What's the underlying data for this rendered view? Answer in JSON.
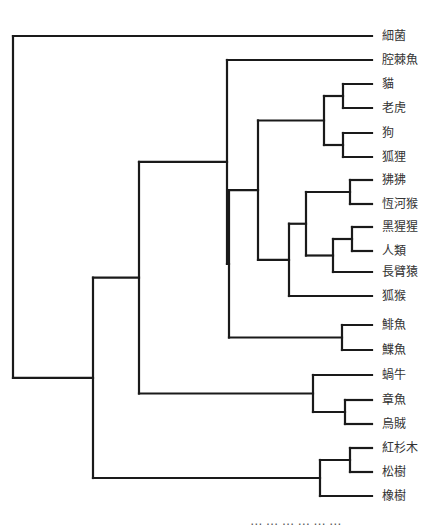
{
  "diagram": {
    "type": "phylogenetic-tree",
    "leaf_x_end": 372,
    "label_x": 382,
    "leaves": [
      {
        "id": "bacteria",
        "label": "細菌",
        "y": 36
      },
      {
        "id": "coelacanth",
        "label": "腔棘魚",
        "y": 60
      },
      {
        "id": "cat",
        "label": "貓",
        "y": 84
      },
      {
        "id": "tiger",
        "label": "老虎",
        "y": 108
      },
      {
        "id": "dog",
        "label": "狗",
        "y": 133
      },
      {
        "id": "fox",
        "label": "狐狸",
        "y": 157
      },
      {
        "id": "baboon",
        "label": "狒狒",
        "y": 180
      },
      {
        "id": "rhesus",
        "label": "恆河猴",
        "y": 204
      },
      {
        "id": "chimp",
        "label": "黑猩猩",
        "y": 227
      },
      {
        "id": "human",
        "label": "人類",
        "y": 251
      },
      {
        "id": "gibbon",
        "label": "長臂猿",
        "y": 272
      },
      {
        "id": "lemur",
        "label": "狐猴",
        "y": 296
      },
      {
        "id": "herring",
        "label": "鯡魚",
        "y": 325
      },
      {
        "id": "flounder",
        "label": "鰈魚",
        "y": 350
      },
      {
        "id": "snail",
        "label": "蝸牛",
        "y": 375
      },
      {
        "id": "octopus",
        "label": "章魚",
        "y": 400
      },
      {
        "id": "squid",
        "label": "烏賊",
        "y": 424
      },
      {
        "id": "redwood",
        "label": "紅杉木",
        "y": 448
      },
      {
        "id": "pine",
        "label": "松樹",
        "y": 472
      },
      {
        "id": "oak",
        "label": "橡樹",
        "y": 496
      }
    ],
    "nodes": [
      {
        "id": "n_catTiger",
        "x": 343,
        "children": [
          "cat",
          "tiger"
        ]
      },
      {
        "id": "n_dogFox",
        "x": 343,
        "children": [
          "dog",
          "fox"
        ]
      },
      {
        "id": "n_carnivora",
        "x": 324,
        "children": [
          "n_catTiger",
          "n_dogFox"
        ]
      },
      {
        "id": "n_oldworld",
        "x": 350,
        "children": [
          "baboon",
          "rhesus"
        ]
      },
      {
        "id": "n_chimpHuman",
        "x": 352,
        "children": [
          "chimp",
          "human"
        ]
      },
      {
        "id": "n_apes",
        "x": 333,
        "children": [
          "n_chimpHuman",
          "gibbon"
        ]
      },
      {
        "id": "n_catarrhini",
        "x": 306,
        "children": [
          "n_oldworld",
          "n_apes"
        ]
      },
      {
        "id": "n_primates",
        "x": 289,
        "children": [
          "n_catarrhini",
          "lemur"
        ]
      },
      {
        "id": "n_mammals",
        "x": 258,
        "children": [
          "n_carnivora",
          "n_primates"
        ]
      },
      {
        "id": "n_fish",
        "x": 342,
        "children": [
          "herring",
          "flounder"
        ]
      },
      {
        "id": "n_bony",
        "x": 229,
        "children": [
          "n_mammals",
          "n_fish"
        ]
      },
      {
        "id": "n_vertebrates",
        "x": 227,
        "children": [
          "coelacanth",
          "n_bony"
        ]
      },
      {
        "id": "n_cephalopods",
        "x": 345,
        "children": [
          "octopus",
          "squid"
        ]
      },
      {
        "id": "n_molluscs",
        "x": 313,
        "children": [
          "snail",
          "n_cephalopods"
        ]
      },
      {
        "id": "n_animals",
        "x": 139,
        "children": [
          "n_vertebrates",
          "n_molluscs"
        ]
      },
      {
        "id": "n_conifers",
        "x": 350,
        "children": [
          "redwood",
          "pine"
        ]
      },
      {
        "id": "n_plants",
        "x": 320,
        "children": [
          "n_conifers",
          "oak"
        ]
      },
      {
        "id": "n_eukaryotes",
        "x": 93,
        "children": [
          "n_animals",
          "n_plants"
        ]
      },
      {
        "id": "n_root",
        "x": 13,
        "children": [
          "bacteria",
          "n_eukaryotes"
        ]
      }
    ]
  },
  "caption": "⋯ ⋯ ⋯ ⋯ ⋯ ⋯"
}
